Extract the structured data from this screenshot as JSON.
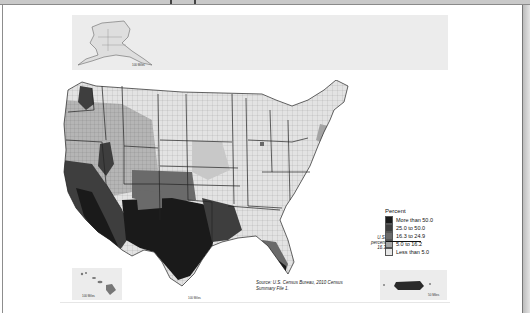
{
  "document": {
    "type": "map-figure",
    "source_note": "Source: U.S. Census Bureau, 2010 Census Summary File 1."
  },
  "legend": {
    "title": "Percent",
    "items": [
      {
        "label": "More than 50.0",
        "color": "#1a1a1a"
      },
      {
        "label": "25.0 to 50.0",
        "color": "#3e3e3e"
      },
      {
        "label": "16.3 to 24.9",
        "color": "#6a6a6a"
      },
      {
        "label": "5.0 to 16.2",
        "color": "#a4a4a4"
      },
      {
        "label": "Less than 5.0",
        "color": "#e6e6e6"
      }
    ],
    "us_percent_label": "U.S. percent 16.3",
    "us_percent_value": 16.3
  },
  "insets": {
    "alaska": {
      "name": "Alaska",
      "scale_label": "100 Miles"
    },
    "hawaii": {
      "name": "Hawaii",
      "scale_label": "100 Miles"
    },
    "hawaii_secondary_scale": {
      "scale_label": "100 Miles"
    },
    "puerto_rico": {
      "name": "Puerto Rico",
      "scale_label": "50 Miles"
    }
  },
  "map": {
    "region": "United States (conterminous)",
    "unit": "county",
    "measure": "Percent",
    "shading_pattern": "Darkest in the Southwest (Texas, New Mexico, Arizona, southern California), moderate in the West and Florida, lightest in the Midwest, Northeast and Southeast interior"
  },
  "colors": {
    "border_dark": "#222222",
    "inset_bg": "#ececec",
    "frame": "#8d8d8d"
  }
}
